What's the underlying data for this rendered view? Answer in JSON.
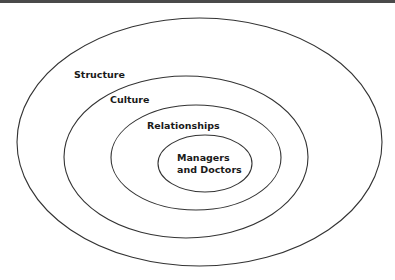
{
  "diagram": {
    "type": "nested-ellipses",
    "layers": [
      {
        "id": "structure",
        "label": "Structure"
      },
      {
        "id": "culture",
        "label": "Culture"
      },
      {
        "id": "relationships",
        "label": "Relationships"
      },
      {
        "id": "core",
        "label_lines": [
          "Managers",
          "and Doctors"
        ]
      }
    ],
    "colors": {
      "stroke": "#333333",
      "text": "#1a1a1a",
      "rule": "#4a4a4a"
    }
  }
}
